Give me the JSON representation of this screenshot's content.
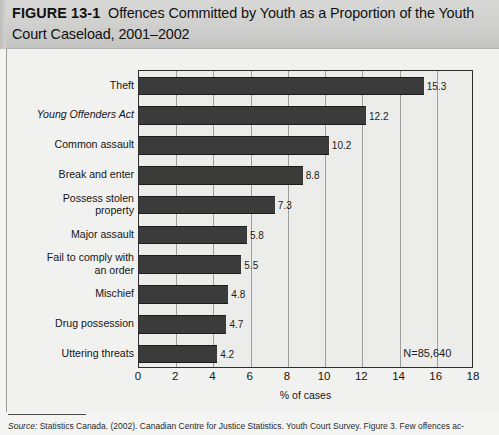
{
  "figure": {
    "number": "FIGURE 13-1",
    "title": "Offences Committed by Youth as a Proportion of the Youth Court Caseload, 2001–2002",
    "source_word": "Source:",
    "source_text": " Statistics Canada. (2002). Canadian Centre for Justice Statistics. Youth Court Survey. Figure 3. Few offences ac-"
  },
  "chart_data": {
    "type": "bar",
    "orientation": "horizontal",
    "title": "Offences Committed by Youth as a Proportion of the Youth Court Caseload, 2001–2002",
    "categories": [
      "Theft",
      "Young Offenders Act",
      "Common assault",
      "Break and enter",
      "Possess stolen\nproperty",
      "Major assault",
      "Fail to comply with\nan order",
      "Mischief",
      "Drug possession",
      "Uttering threats"
    ],
    "category_styles": [
      "normal",
      "italic",
      "normal",
      "normal",
      "normal",
      "normal",
      "normal",
      "normal",
      "normal",
      "normal"
    ],
    "values": [
      15.3,
      12.2,
      10.2,
      8.8,
      7.3,
      5.8,
      5.5,
      4.8,
      4.7,
      4.2
    ],
    "value_labels": [
      "15.3",
      "12.2",
      "10.2",
      "8.8",
      "7.3",
      "5.8",
      "5.5",
      "4.8",
      "4.7",
      "4.2"
    ],
    "xlabel": "% of cases",
    "ylabel": "",
    "xlim": [
      0,
      18
    ],
    "xticks": [
      0,
      2,
      4,
      6,
      8,
      10,
      12,
      14,
      16,
      18
    ],
    "xtick_labels": [
      "0",
      "2",
      "4",
      "6",
      "8",
      "10",
      "12",
      "14",
      "16",
      "18"
    ],
    "grid": "vertical",
    "legend": "none",
    "annotation": "N=85,640",
    "bar_color": "#3b3b3b",
    "plot_background": "#ececea",
    "gridline_color": "#9e9e9c",
    "axis_color": "#2e2e2e"
  }
}
